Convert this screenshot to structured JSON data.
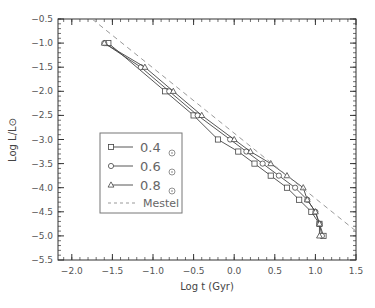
{
  "chart_data": {
    "type": "line",
    "title": "",
    "xlabel": "Log t (Gyr)",
    "ylabel": "Log L/L⊙",
    "xlim": [
      -2.17,
      1.5
    ],
    "ylim": [
      -5.5,
      -0.5
    ],
    "x_ticks": [
      -2.0,
      -1.5,
      -1.0,
      -0.5,
      0.0,
      0.5,
      1.0,
      1.5
    ],
    "x_tick_labels": [
      "-2.0",
      "-1.5",
      "-1.0",
      "-0.5",
      "0.0",
      "0.5",
      "1.0",
      "1.5"
    ],
    "y_ticks": [
      -0.5,
      -1.0,
      -1.5,
      -2.0,
      -2.5,
      -3.0,
      -3.5,
      -4.0,
      -4.5,
      -5.0,
      -5.5
    ],
    "y_tick_labels": [
      "-0.5",
      "-1.0",
      "-1.5",
      "-2.0",
      "-2.5",
      "-3.0",
      "-3.5",
      "-4.0",
      "-4.5",
      "-5.0",
      "-5.5"
    ],
    "grid": false,
    "legend_position": "lower-left inside",
    "series": [
      {
        "name": "0.4 ⊙",
        "marker": "square",
        "x": [
          -1.55,
          -0.85,
          -0.5,
          -0.2,
          0.05,
          0.25,
          0.45,
          0.65,
          0.8,
          0.95,
          1.05,
          1.1
        ],
        "y": [
          -1.0,
          -2.0,
          -2.5,
          -3.0,
          -3.25,
          -3.5,
          -3.75,
          -4.0,
          -4.25,
          -4.5,
          -4.75,
          -5.0
        ]
      },
      {
        "name": "0.6 ⊙",
        "marker": "circle",
        "x": [
          -1.6,
          -1.15,
          -0.8,
          -0.45,
          -0.05,
          0.15,
          0.35,
          0.55,
          0.75,
          0.9,
          1.0,
          1.05,
          1.08
        ],
        "y": [
          -1.0,
          -1.5,
          -2.0,
          -2.5,
          -3.0,
          -3.25,
          -3.5,
          -3.75,
          -4.0,
          -4.25,
          -4.5,
          -4.75,
          -5.0
        ]
      },
      {
        "name": "0.8 ⊙",
        "marker": "triangle",
        "x": [
          -1.6,
          -1.1,
          -0.75,
          -0.4,
          0.0,
          0.2,
          0.45,
          0.65,
          0.85,
          0.9,
          1.0,
          1.05,
          1.05
        ],
        "y": [
          -1.0,
          -1.5,
          -2.0,
          -2.5,
          -3.0,
          -3.25,
          -3.5,
          -3.75,
          -4.0,
          -4.25,
          -4.5,
          -4.75,
          -5.0
        ]
      },
      {
        "name": "Mestel",
        "marker": "none",
        "style": "dashed",
        "x": [
          -1.75,
          1.5
        ],
        "y": [
          -0.5,
          -4.9
        ]
      }
    ]
  },
  "legend": {
    "items": [
      {
        "label": "0.4",
        "unit": "⊙",
        "marker": "square"
      },
      {
        "label": "0.6",
        "unit": "⊙",
        "marker": "circle"
      },
      {
        "label": "0.8",
        "unit": "⊙",
        "marker": "triangle"
      },
      {
        "label": "Mestel",
        "marker": "dashed"
      }
    ]
  },
  "colors": {
    "axis": "#333333",
    "series": "#444444",
    "mestel": "#999999",
    "text": "#555555"
  }
}
